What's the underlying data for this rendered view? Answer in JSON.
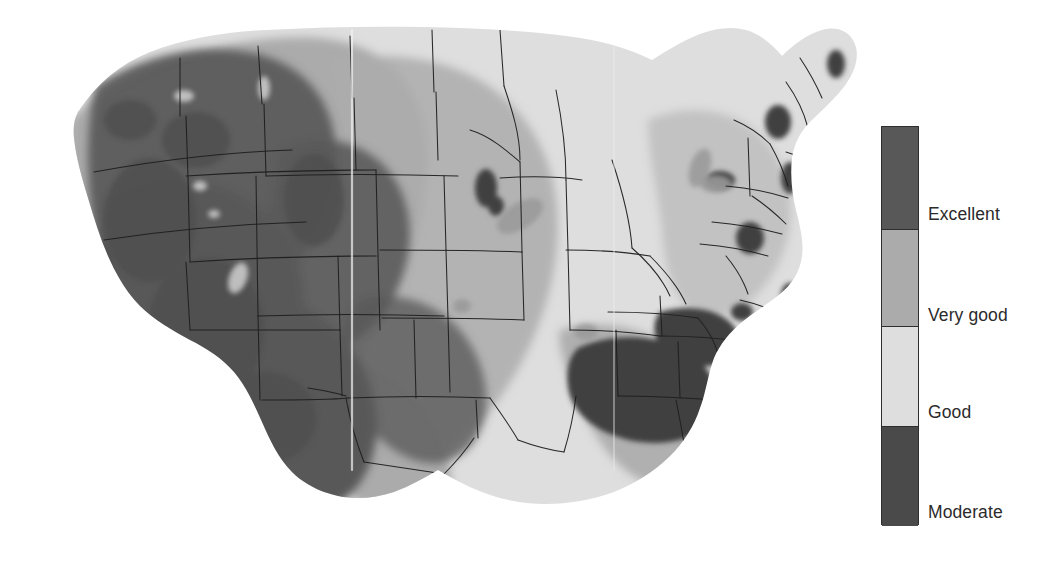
{
  "figure": {
    "kind": "choropleth-contour-map",
    "region": "Contiguous United States",
    "alt": "Grayscale shaded contour map of the contiguous United States showing resource quality classes"
  },
  "legend": {
    "name": "resource-quality-legend",
    "orientation": "vertical",
    "bar": {
      "x": 881,
      "y": 126,
      "width": 38,
      "height": 399,
      "border_color": "#2e2e2e"
    },
    "classes": [
      {
        "label": "Excellent",
        "color": "#585858",
        "top": 0,
        "height": 102,
        "label_y": 80
      },
      {
        "label": "Very good",
        "color": "#ababab",
        "top": 102,
        "height": 97,
        "label_y": 181
      },
      {
        "label": "Good",
        "color": "#dedede",
        "top": 199,
        "height": 100,
        "label_y": 278
      },
      {
        "label": "Moderate",
        "color": "#4a4a4a",
        "top": 299,
        "height": 100,
        "label_y": 378
      }
    ]
  },
  "chart_data": {
    "type": "heatmap",
    "title": "",
    "xlabel": "",
    "ylabel": "",
    "grid": false,
    "legend_position": "right",
    "categories": [
      "Excellent",
      "Very good",
      "Good",
      "Moderate"
    ],
    "category_colors": [
      "#585858",
      "#ababab",
      "#dedede",
      "#4a4a4a"
    ],
    "regions": [
      {
        "name": "Desert Southwest (AZ, NV, S. CA, S. UT, NM)",
        "class": "Excellent"
      },
      {
        "name": "Intermountain West (ID, OR interior, MT west, WY, CO)",
        "class": "Excellent"
      },
      {
        "name": "Great Basin / Sierra lee",
        "class": "Excellent"
      },
      {
        "name": "Northern Plains (ND, SD, NE, KS)",
        "class": "Very good"
      },
      {
        "name": "Pacific Northwest coast",
        "class": "Very good"
      },
      {
        "name": "Texas Gulf / South Plains",
        "class": "Very good"
      },
      {
        "name": "Upper Midwest (MN, WI, MI, IA, IL)",
        "class": "Good"
      },
      {
        "name": "Ohio Valley and Mid-Atlantic",
        "class": "Good"
      },
      {
        "name": "Southeast coastal plain (GA, FL, SC)",
        "class": "Good"
      },
      {
        "name": "Lower Mississippi Valley (AR, N. LA, MS)",
        "class": "Moderate"
      },
      {
        "name": "Southern Appalachians",
        "class": "Moderate"
      },
      {
        "name": "Scattered Northeast uplands (VT, NH, ME, NY)",
        "class": "Moderate"
      }
    ]
  }
}
